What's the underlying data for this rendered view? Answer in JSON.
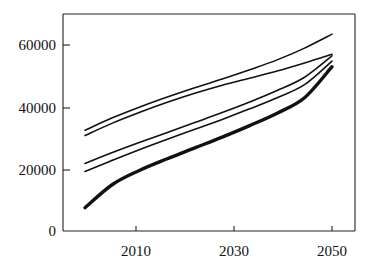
{
  "chart_data": {
    "type": "line",
    "title": "",
    "subtitle": "",
    "xlabel": "",
    "ylabel": "",
    "xlim": [
      2005,
      2055
    ],
    "ylim": [
      0,
      70000
    ],
    "grid": false,
    "legend": "none",
    "x_ticks": [
      2010,
      2030,
      2050
    ],
    "x_tick_labels": [
      "2010",
      "2030",
      "2050"
    ],
    "y_ticks": [
      0,
      20000,
      40000,
      60000
    ],
    "y_tick_labels": [
      "0",
      "20000",
      "40000",
      "60000"
    ],
    "x": [
      2005,
      2010,
      2015,
      2020,
      2025,
      2030,
      2035,
      2040,
      2045,
      2050
    ],
    "series": [
      {
        "name": "series-1-top",
        "stroke_width": 1.6,
        "values": [
          32500,
          36500,
          40000,
          43200,
          46200,
          49000,
          52000,
          55200,
          59000,
          63500
        ]
      },
      {
        "name": "series-2",
        "stroke_width": 1.6,
        "values": [
          30800,
          34800,
          38300,
          41500,
          44400,
          47000,
          49300,
          51600,
          54200,
          57000
        ]
      },
      {
        "name": "series-3",
        "stroke_width": 1.6,
        "values": [
          21800,
          25300,
          28600,
          31800,
          35000,
          38200,
          41600,
          45300,
          49600,
          56500
        ]
      },
      {
        "name": "series-4",
        "stroke_width": 1.6,
        "values": [
          19200,
          22800,
          26300,
          29600,
          32800,
          36000,
          39400,
          43000,
          47200,
          54800
        ]
      },
      {
        "name": "series-5-bottom-thick",
        "stroke_width": 3.4,
        "values": [
          7500,
          15000,
          19600,
          23300,
          26800,
          30300,
          34000,
          38000,
          43000,
          53000
        ]
      }
    ],
    "colors": {
      "line": "#111111",
      "axis": "#222222",
      "background": "#ffffff"
    }
  },
  "axes": {
    "y_labels": [
      "60000",
      "40000",
      "20000",
      "0"
    ],
    "x_labels": [
      "2010",
      "2030",
      "2050"
    ]
  }
}
